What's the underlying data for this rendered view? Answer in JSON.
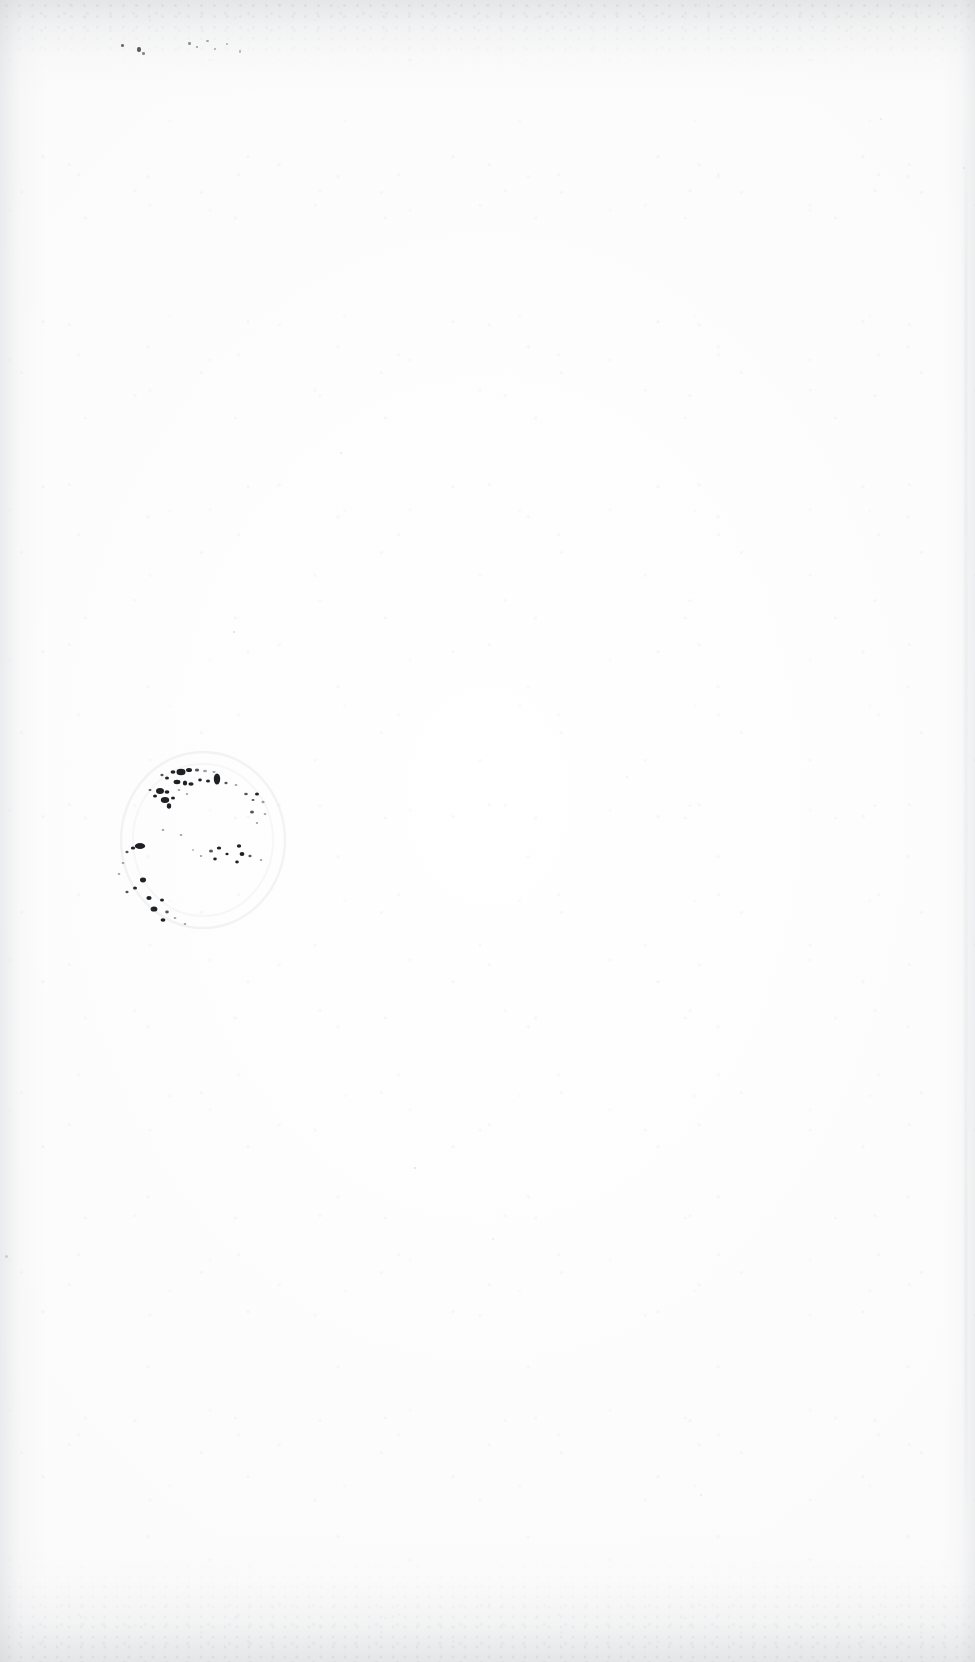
{
  "document": {
    "page_label": "",
    "page_content_text": "",
    "description": "Blank scanned book page with faded circular ownership ink stamp",
    "background_color": "#fefefe",
    "paper_tone": "#fdfdfd"
  },
  "page": {
    "width": 975,
    "height": 1662
  },
  "artifacts": {
    "stamp": {
      "name": "circular-ink-stamp",
      "ink_color": "#1e2024",
      "center_x": 205,
      "center_y": 838,
      "radius_x": 83,
      "radius_y": 92,
      "legible_text": "",
      "condition": "mostly-faded"
    },
    "top_left_flecks": {
      "name": "ink-flecks",
      "color": "#3c3e42",
      "count": 9
    },
    "edge_shading": {
      "top_color": "#c6c8cc",
      "bottom_color": "#c4c6ca",
      "left_color": "#cacccf",
      "right_color": "#ced0d4"
    }
  }
}
